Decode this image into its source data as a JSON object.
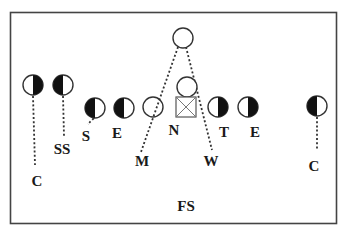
{
  "diagram": {
    "offense": [
      {
        "id": "qb",
        "symbol": "open-circle",
        "role": "deep back"
      },
      {
        "id": "back",
        "symbol": "open-circle",
        "role": "back"
      },
      {
        "id": "center",
        "symbol": "square-x",
        "role": "center"
      },
      {
        "id": "left-open",
        "symbol": "open-circle",
        "role": "back"
      }
    ],
    "defense": [
      {
        "id": "c-left",
        "label": "C",
        "fill": "right"
      },
      {
        "id": "ss",
        "label": "SS",
        "fill": "left"
      },
      {
        "id": "s",
        "label": "S",
        "fill": "left"
      },
      {
        "id": "e-left",
        "label": "E",
        "fill": "left"
      },
      {
        "id": "n",
        "label": "N"
      },
      {
        "id": "m",
        "label": "M"
      },
      {
        "id": "w",
        "label": "W"
      },
      {
        "id": "t",
        "label": "T",
        "fill": "right"
      },
      {
        "id": "e-right",
        "label": "E",
        "fill": "right"
      },
      {
        "id": "c-right",
        "label": "C",
        "fill": "left"
      },
      {
        "id": "fs",
        "label": "FS"
      }
    ]
  }
}
